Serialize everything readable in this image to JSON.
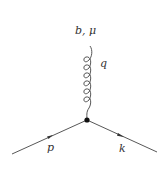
{
  "diagram": {
    "type": "feynman-vertex",
    "labels": {
      "gluon_index": "b, μ",
      "gluon_momentum": "q",
      "incoming_momentum": "p",
      "outgoing_momentum": "k"
    },
    "colors": {
      "line": "#333333",
      "background": "#ffffff"
    }
  }
}
